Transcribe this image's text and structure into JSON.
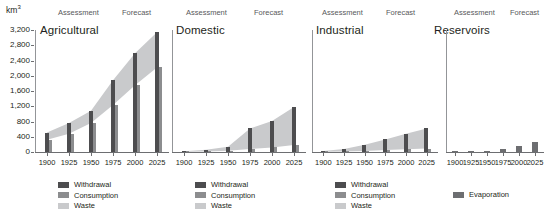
{
  "figure": {
    "y_unit": "km",
    "y_unit_sup": "3",
    "y_ticks": [
      "3,200",
      "2,800",
      "2,400",
      "2,000",
      "1,600",
      "1,200",
      "800",
      "400",
      "0"
    ],
    "x_ticks": [
      "1900",
      "1925",
      "1950",
      "1975",
      "2000",
      "2025"
    ],
    "period_assessment": "Assessment",
    "period_forecast": "Forecast",
    "colors": {
      "withdrawal": "#4d4d4f",
      "consumption": "#8c8d8f",
      "waste": "#c9cacc",
      "evaporation": "#6d6e71",
      "axis": "#6d6e71",
      "text": "#231f20"
    },
    "legend_withdrawal": "Withdrawal",
    "legend_consumption": "Consumption",
    "legend_waste": "Waste",
    "legend_evaporation": "Evaporation",
    "panels": [
      {
        "title": "Agricultural"
      },
      {
        "title": "Domestic"
      },
      {
        "title": "Industrial"
      },
      {
        "title": "Reservoirs"
      }
    ]
  },
  "chart_data": [
    {
      "type": "bar",
      "title": "Agricultural",
      "xlabel": "",
      "ylabel": "km3",
      "ylim": [
        0,
        3200
      ],
      "grid": false,
      "legend_position": "bottom",
      "categories": [
        "1900",
        "1925",
        "1950",
        "1975",
        "2000",
        "2025"
      ],
      "series": [
        {
          "name": "Withdrawal",
          "values": [
            510,
            760,
            1080,
            1880,
            2590,
            3140
          ]
        },
        {
          "name": "Consumption",
          "values": [
            320,
            480,
            760,
            1230,
            1750,
            2220
          ]
        },
        {
          "name": "Waste",
          "values": [
            190,
            280,
            320,
            650,
            840,
            920
          ]
        }
      ],
      "annotations": [
        "Assessment",
        "Forecast"
      ]
    },
    {
      "type": "bar",
      "title": "Domestic",
      "xlabel": "",
      "ylabel": "km3",
      "ylim": [
        0,
        3200
      ],
      "grid": false,
      "legend_position": "bottom",
      "categories": [
        "1900",
        "1925",
        "1950",
        "1975",
        "2000",
        "2025"
      ],
      "series": [
        {
          "name": "Withdrawal",
          "values": [
            20,
            60,
            140,
            620,
            810,
            1180
          ]
        },
        {
          "name": "Consumption",
          "values": [
            5,
            15,
            35,
            80,
            120,
            180
          ]
        },
        {
          "name": "Waste",
          "values": [
            15,
            45,
            105,
            540,
            690,
            1000
          ]
        }
      ],
      "annotations": [
        "Assessment",
        "Forecast"
      ]
    },
    {
      "type": "bar",
      "title": "Industrial",
      "xlabel": "",
      "ylabel": "km3",
      "ylim": [
        0,
        3200
      ],
      "grid": false,
      "legend_position": "bottom",
      "categories": [
        "1900",
        "1925",
        "1950",
        "1975",
        "2000",
        "2025"
      ],
      "series": [
        {
          "name": "Withdrawal",
          "values": [
            30,
            80,
            190,
            330,
            480,
            620
          ]
        },
        {
          "name": "Consumption",
          "values": [
            5,
            15,
            30,
            50,
            70,
            90
          ]
        },
        {
          "name": "Waste",
          "values": [
            25,
            65,
            160,
            280,
            410,
            530
          ]
        }
      ],
      "annotations": [
        "Assessment",
        "Forecast"
      ]
    },
    {
      "type": "bar",
      "title": "Reservoirs",
      "xlabel": "",
      "ylabel": "km3",
      "ylim": [
        0,
        3200
      ],
      "grid": false,
      "legend_position": "bottom",
      "categories": [
        "1900",
        "1925",
        "1950",
        "1975",
        "2000",
        "2025"
      ],
      "series": [
        {
          "name": "Evaporation",
          "values": [
            10,
            20,
            15,
            90,
            170,
            250
          ]
        }
      ],
      "annotations": [
        "Assessment",
        "Forecast"
      ]
    }
  ]
}
